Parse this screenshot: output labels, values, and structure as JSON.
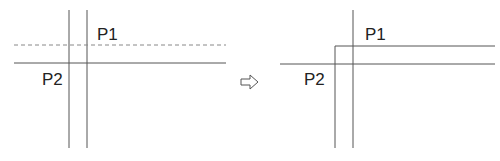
{
  "figure": {
    "before": {
      "labels": {
        "p1": "P1",
        "p2": "P2"
      }
    },
    "arrow": {
      "glyph": "⇨"
    },
    "after": {
      "labels": {
        "p1": "P1",
        "p2": "P2"
      }
    },
    "colors": {
      "line": "#555555",
      "dashed": "#888888",
      "text": "#222222"
    }
  }
}
